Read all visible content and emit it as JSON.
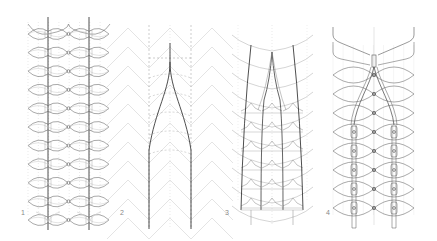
{
  "figure": {
    "panels": [
      {
        "id": 1,
        "label": "1",
        "label_pos": [
          21,
          209
        ],
        "type": "double-column-lattice",
        "cx": [
          48,
          89
        ],
        "x_range": [
          28,
          110
        ],
        "y_range": [
          17,
          230
        ],
        "rows": 11,
        "row_top": 24,
        "row_step": 18.6
      },
      {
        "id": 2,
        "label": "2",
        "label_pos": [
          120,
          209
        ],
        "type": "chevron-grid-with-branch",
        "cx": 170,
        "rails": [
          149,
          191
        ],
        "x_range": [
          128,
          212
        ],
        "y_range": [
          25,
          229
        ],
        "apex_y": 43,
        "branch_join_y": 150,
        "chevron_step": 19
      },
      {
        "id": 3,
        "label": "3",
        "label_pos": [
          225,
          209
        ],
        "type": "converging-frame",
        "cx": 272,
        "x_range": [
          230,
          315
        ],
        "y_range": [
          25,
          225
        ],
        "top_y": 35,
        "outer_top": [
          251,
          293
        ],
        "outer_bottom": [
          241,
          303
        ],
        "inner_bottom": [
          261,
          283
        ],
        "bottom_y": 210,
        "row_step": 19
      },
      {
        "id": 4,
        "label": "4",
        "label_pos": [
          326,
          209
        ],
        "type": "branching-lattice",
        "cx": 374,
        "x_range": [
          333,
          414
        ],
        "y_range": [
          27,
          228
        ],
        "columns": [
          354,
          394
        ],
        "row_top": 75,
        "row_step": 19,
        "rows": 8
      }
    ],
    "colors": {
      "line": "#555555",
      "light": "#c8c8c8",
      "dark": "#222222",
      "label": "#888888"
    }
  }
}
